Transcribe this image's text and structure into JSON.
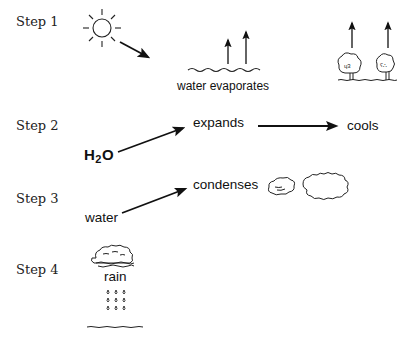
{
  "diagram": {
    "type": "process-flow",
    "topic": "water cycle steps",
    "steps": [
      {
        "label": "Step 1",
        "icons": [
          "sun-icon",
          "arrow-icon",
          "water-waves-icon",
          "evaporation-arrows-icon",
          "trees-icon",
          "transpiration-arrows-icon"
        ],
        "caption": "water evaporates"
      },
      {
        "label": "Step 2",
        "start": {
          "base": "H",
          "sub": "2",
          "tail": "O"
        },
        "nodes": [
          "expands",
          "cools"
        ]
      },
      {
        "label": "Step 3",
        "start": "water",
        "nodes": [
          "condenses"
        ],
        "icons": [
          "small-cloud-icon",
          "large-cloud-icon"
        ]
      },
      {
        "label": "Step 4",
        "caption": "rain",
        "icons": [
          "rain-cloud-icon",
          "raindrops-icon",
          "ground-line-icon"
        ]
      }
    ]
  }
}
